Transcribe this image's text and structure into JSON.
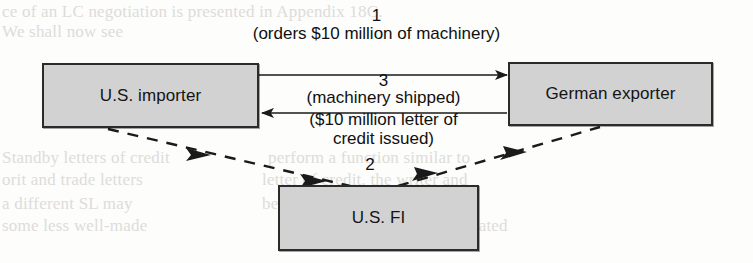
{
  "figure": {
    "type": "flow-diagram",
    "nodes": [
      {
        "id": "importer",
        "label": "U.S. importer"
      },
      {
        "id": "exporter",
        "label": "German exporter"
      },
      {
        "id": "usfi",
        "label": "U.S. FI"
      }
    ],
    "flows": [
      {
        "step": "1",
        "text": "(orders $10 million of machinery)",
        "from": "importer",
        "to": "exporter",
        "style": "solid"
      },
      {
        "step": "3",
        "text": "(machinery shipped)",
        "from": "exporter",
        "to": "importer",
        "style": "solid"
      },
      {
        "step": "2",
        "text": "($10 million letter of credit issued)",
        "text_line1": "($10 million letter of",
        "text_line2": "credit issued)",
        "from": "importer",
        "to": "exporter",
        "via": "usfi",
        "style": "dashed"
      }
    ],
    "colors": {
      "box_fill": "#d2d2d2",
      "box_border": "#2b2b2b",
      "line": "#1a1a1a",
      "text": "#101010",
      "background": "#fdfdfc",
      "ghost_text": "#d9d7d4"
    }
  },
  "background_text": {
    "lines": [
      {
        "text": "ce of an LC negotiation is presented in Appendix 18C.",
        "x": 0,
        "y": 2
      },
      {
        "text": "We shall now see",
        "x": 0,
        "y": 22
      },
      {
        "text": "Standby letters of credit",
        "x": 0,
        "y": 148
      },
      {
        "text": "orit and trade letters",
        "x": 0,
        "y": 170
      },
      {
        "text": "a different SL may",
        "x": 0,
        "y": 194
      },
      {
        "text": "some less well-made",
        "x": 0,
        "y": 216
      },
      {
        "text": "in part",
        "x": 318,
        "y": 148
      },
      {
        "text": "perform a function similar to",
        "x": 268,
        "y": 148
      },
      {
        "text": "of credit in that, like the",
        "x": 262,
        "y": 170
      },
      {
        "text": "letter of credit, the writer and",
        "x": 258,
        "y": 170
      },
      {
        "text": "be used to guarantee payment",
        "x": 262,
        "y": 194
      },
      {
        "text": "on a particular project",
        "x": 430,
        "y": 194
      },
      {
        "text": "are not necessarily trade related",
        "x": 286,
        "y": 216
      }
    ]
  }
}
